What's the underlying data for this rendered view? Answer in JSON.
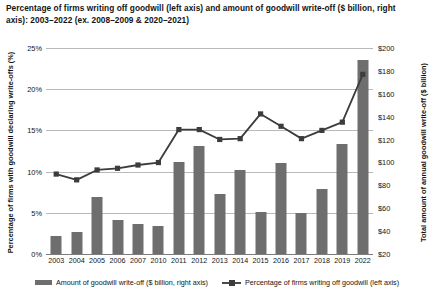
{
  "chart_data": {
    "type": "bar",
    "title": "Percentage of firms writing off goodwill (left axis) and amount of goodwill write-off ($ billion, right axis): 2003–2022 (ex. 2008–2009 & 2020–2021)",
    "xlabel": "",
    "ylabel": "Percentage of firms with goodwill declaring write-offs (%)",
    "y2label": "Total amount of annual goodwill write-off ($ billion)",
    "categories": [
      "2003",
      "2004",
      "2005",
      "2006",
      "2007",
      "2010",
      "2011",
      "2012",
      "2013",
      "2014",
      "2015",
      "2016",
      "2017",
      "2018",
      "2019",
      "2022"
    ],
    "grid": true,
    "legend_position": "bottom",
    "ylim": [
      0,
      25
    ],
    "yticks": [
      "0%",
      "5%",
      "10%",
      "15%",
      "20%",
      "25%"
    ],
    "ytick_values": [
      0,
      5,
      10,
      15,
      20,
      25
    ],
    "y2lim": [
      20,
      200
    ],
    "y2ticks": [
      "$20",
      "$40",
      "$60",
      "$80",
      "$100",
      "$120",
      "$140",
      "$160",
      "$180",
      "$200"
    ],
    "y2tick_values": [
      20,
      40,
      60,
      80,
      100,
      120,
      140,
      160,
      180,
      200
    ],
    "series": [
      {
        "name": "Amount of goodwill write-off ($ billion, right axis)",
        "type": "bar",
        "axis": "right",
        "color": "#6e6e6e",
        "values": [
          37,
          42,
          70,
          52,
          47,
          45,
          110,
          126,
          78,
          102,
          70,
          110,
          68,
          82,
          128,
          190
        ],
        "values_pct_scale": [
          2.2,
          2.7,
          6.9,
          4.1,
          3.6,
          3.4,
          11.2,
          13.1,
          7.3,
          10.2,
          5.1,
          11.1,
          5.0,
          7.9,
          13.3,
          23.5
        ]
      },
      {
        "name": "Percentage of firms writing off goodwill (left axis)",
        "type": "line",
        "axis": "left",
        "color": "#3c3c3c",
        "values": [
          9.7,
          9.0,
          10.2,
          10.4,
          10.8,
          11.1,
          15.1,
          15.1,
          13.9,
          14.0,
          17.0,
          15.5,
          14.0,
          15.0,
          16.0,
          21.8
        ]
      }
    ]
  },
  "legend": {
    "bar_label": "Amount of goodwill write-off ($ billion, right axis)",
    "line_label": "Percentage of firms writing off goodwill (left axis)"
  }
}
